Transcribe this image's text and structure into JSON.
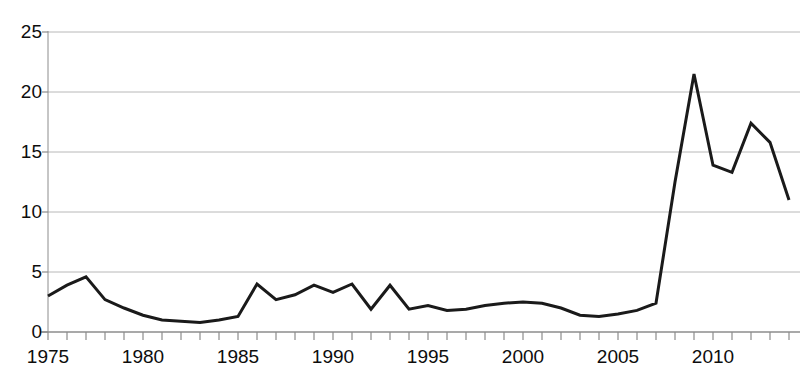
{
  "chart_data": {
    "type": "line",
    "title": "",
    "subtitle": "",
    "xlabel": "",
    "ylabel": "",
    "xlim": [
      1975,
      2014
    ],
    "ylim": [
      0,
      25
    ],
    "grid": true,
    "legend": null,
    "y_ticks": [
      0,
      5,
      10,
      15,
      20,
      25
    ],
    "y_tick_labels": [
      "0",
      "5",
      "10",
      "15",
      "20",
      "25"
    ],
    "x_tick_labels": [
      "1975",
      "1980",
      "1985",
      "1990",
      "1995",
      "2000",
      "2005",
      "2010"
    ],
    "x_tick_label_values": [
      1975,
      1980,
      1985,
      1990,
      1995,
      2000,
      2005,
      2010
    ],
    "x_minor_tick_step": 1,
    "line_color": "#1a1a1a",
    "line_width": 3,
    "grid_color": "#b8b8b8",
    "axis_color": "#8c8c8c",
    "x": [
      1975,
      1976,
      1977,
      1978,
      1979,
      1980,
      1981,
      1982,
      1983,
      1984,
      1985,
      1986,
      1987,
      1988,
      1989,
      1990,
      1991,
      1992,
      1993,
      1994,
      1995,
      1996,
      1997,
      1998,
      1999,
      2000,
      2001,
      2002,
      2003,
      2004,
      2005,
      2006,
      2007,
      2008,
      2009,
      2010,
      2011,
      2012,
      2013,
      2014
    ],
    "values": [
      3.0,
      3.9,
      4.6,
      2.7,
      2.0,
      1.4,
      1.0,
      0.9,
      0.8,
      1.0,
      1.3,
      4.0,
      2.7,
      3.1,
      3.9,
      3.3,
      4.0,
      1.9,
      3.9,
      1.9,
      2.2,
      1.8,
      1.9,
      2.2,
      2.4,
      2.5,
      2.4,
      2.0,
      1.4,
      1.3,
      1.5,
      1.8,
      2.4,
      12.5,
      21.5,
      13.9,
      13.3,
      17.4,
      15.8,
      11.0
    ],
    "series": [
      {
        "name": "series-1",
        "values": [
          3.0,
          3.9,
          4.6,
          2.7,
          2.0,
          1.4,
          1.0,
          0.9,
          0.8,
          1.0,
          1.3,
          4.0,
          2.7,
          3.1,
          3.9,
          3.3,
          4.0,
          1.9,
          3.9,
          1.9,
          2.2,
          1.8,
          1.9,
          2.2,
          2.4,
          2.5,
          2.4,
          2.0,
          1.4,
          1.3,
          1.5,
          1.8,
          2.4,
          12.5,
          21.5,
          13.9,
          13.3,
          17.4,
          15.8,
          11.0
        ]
      }
    ]
  }
}
